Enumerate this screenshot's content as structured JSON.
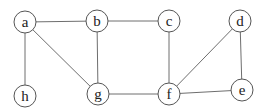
{
  "graph": {
    "type": "undirected",
    "node_radius": 11,
    "nodes": [
      {
        "id": "a",
        "label": "a",
        "x": 25,
        "y": 22
      },
      {
        "id": "b",
        "label": "b",
        "x": 97,
        "y": 21
      },
      {
        "id": "c",
        "label": "c",
        "x": 169,
        "y": 21
      },
      {
        "id": "d",
        "label": "d",
        "x": 240,
        "y": 21
      },
      {
        "id": "h",
        "label": "h",
        "x": 25,
        "y": 96
      },
      {
        "id": "g",
        "label": "g",
        "x": 98,
        "y": 94
      },
      {
        "id": "f",
        "label": "f",
        "x": 169,
        "y": 94
      },
      {
        "id": "e",
        "label": "e",
        "x": 242,
        "y": 90
      }
    ],
    "edges": [
      [
        "a",
        "b"
      ],
      [
        "a",
        "h"
      ],
      [
        "a",
        "g"
      ],
      [
        "b",
        "c"
      ],
      [
        "b",
        "g"
      ],
      [
        "c",
        "f"
      ],
      [
        "d",
        "f"
      ],
      [
        "d",
        "e"
      ],
      [
        "g",
        "f"
      ],
      [
        "f",
        "e"
      ]
    ],
    "colors": {
      "edge": "#6e6e6e",
      "node_stroke": "#555555",
      "node_fill": "#ffffff",
      "label": "#222222"
    }
  }
}
